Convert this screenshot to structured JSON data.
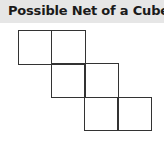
{
  "header": {
    "title": "Possible Net of a Cube"
  },
  "net": {
    "square_size": 34,
    "line_color": "#333333",
    "squares": [
      {
        "row": 0,
        "col": 0
      },
      {
        "row": 0,
        "col": 1
      },
      {
        "row": 1,
        "col": 1
      },
      {
        "row": 1,
        "col": 2
      },
      {
        "row": 2,
        "col": 2
      },
      {
        "row": 2,
        "col": 3
      }
    ]
  }
}
